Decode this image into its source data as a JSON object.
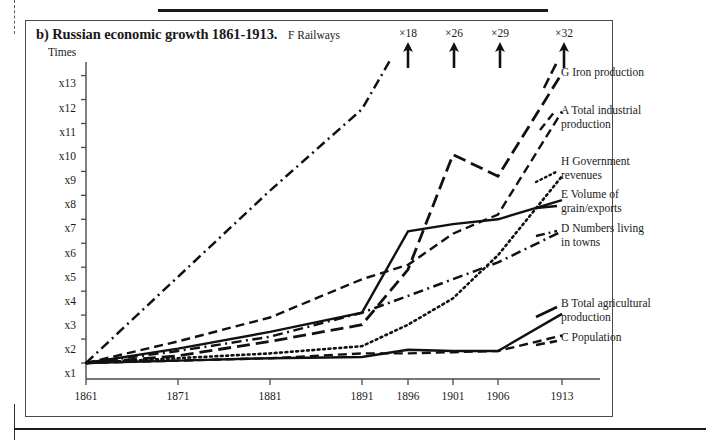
{
  "figure": {
    "label": "b)",
    "title": "b) Russian economic growth 1861-1913.",
    "axis_title": "Times",
    "railways_note": "F Railways"
  },
  "arrows": [
    {
      "name": "arrow-x18",
      "label": "×18"
    },
    {
      "name": "arrow-x26",
      "label": "×26"
    },
    {
      "name": "arrow-x29",
      "label": "×29"
    },
    {
      "name": "arrow-x32",
      "label": "×32"
    }
  ],
  "legend": [
    {
      "key": "G",
      "text": "G Iron production"
    },
    {
      "key": "A",
      "text": "A Total industrial\n     production"
    },
    {
      "key": "H",
      "text": "H Government\n     revenues"
    },
    {
      "key": "E",
      "text": "E  Volume of\n    grain/exports"
    },
    {
      "key": "D",
      "text": "D Numbers living\n    in towns"
    },
    {
      "key": "B",
      "text": "B Total agricultural\n    production"
    },
    {
      "key": "C",
      "text": "C Population"
    }
  ],
  "chart_data": {
    "type": "line",
    "title": "b) Russian economic growth 1861-1913.",
    "xlabel": "",
    "ylabel": "Times",
    "x": [
      1861,
      1871,
      1881,
      1891,
      1896,
      1901,
      1906,
      1913
    ],
    "xtick_labels": [
      "1861",
      "1871",
      "1881",
      "1891",
      "1896",
      "1901",
      "1906",
      "1913"
    ],
    "ytick_labels": [
      "x1",
      "x2",
      "x3",
      "x4",
      "x5",
      "x6",
      "x7",
      "x8",
      "x9",
      "x10",
      "x11",
      "x12",
      "x13"
    ],
    "ylim": [
      1,
      13.6
    ],
    "xlim": [
      1861,
      1916
    ],
    "grid": false,
    "legend_position": "right",
    "annotations": [
      "×18 at 1896",
      "×26 at 1901",
      "×29 at 1906",
      "×32 at 1913"
    ],
    "series": [
      {
        "name": "F Railways",
        "letter": "F",
        "style": "dash-dot",
        "x": [
          1861,
          1871,
          1881,
          1891,
          1894
        ],
        "values": [
          1.0,
          4.6,
          8.2,
          11.6,
          13.6
        ]
      },
      {
        "name": "G Iron production",
        "letter": "G",
        "style": "long-dash",
        "x": [
          1861,
          1871,
          1881,
          1891,
          1896,
          1901,
          1906,
          1913
        ],
        "values": [
          1.0,
          1.3,
          1.9,
          2.6,
          4.9,
          9.7,
          8.8,
          13.1
        ]
      },
      {
        "name": "A Total industrial production",
        "letter": "A",
        "style": "dashed",
        "x": [
          1861,
          1871,
          1881,
          1891,
          1896,
          1901,
          1906,
          1913
        ],
        "values": [
          1.0,
          1.9,
          2.9,
          4.5,
          5.1,
          6.4,
          7.2,
          11.5
        ]
      },
      {
        "name": "H Government revenues",
        "letter": "H",
        "style": "dotted",
        "x": [
          1861,
          1871,
          1881,
          1891,
          1896,
          1901,
          1906,
          1913
        ],
        "values": [
          1.0,
          1.2,
          1.4,
          1.7,
          2.6,
          3.7,
          5.5,
          8.8
        ]
      },
      {
        "name": "E Volume of grain/exports",
        "letter": "E",
        "style": "solid",
        "x": [
          1861,
          1871,
          1881,
          1891,
          1896,
          1901,
          1906,
          1913
        ],
        "values": [
          1.0,
          1.6,
          2.3,
          3.1,
          6.5,
          6.8,
          7.0,
          7.8
        ]
      },
      {
        "name": "D Numbers living in towns",
        "letter": "D",
        "style": "dash-dot",
        "x": [
          1861,
          1871,
          1881,
          1891,
          1896,
          1901,
          1906,
          1913
        ],
        "values": [
          1.0,
          1.5,
          2.1,
          3.1,
          3.8,
          4.5,
          5.2,
          6.5
        ]
      },
      {
        "name": "B Total agricultural production",
        "letter": "B",
        "style": "solid",
        "x": [
          1861,
          1871,
          1881,
          1891,
          1896,
          1901,
          1906,
          1913
        ],
        "values": [
          1.0,
          1.1,
          1.2,
          1.25,
          1.55,
          1.5,
          1.5,
          3.05
        ]
      },
      {
        "name": "C Population",
        "letter": "C",
        "style": "dashed",
        "x": [
          1861,
          1871,
          1881,
          1891,
          1896,
          1901,
          1906,
          1913
        ],
        "values": [
          1.0,
          1.1,
          1.2,
          1.4,
          1.4,
          1.45,
          1.5,
          2.15
        ]
      }
    ]
  }
}
